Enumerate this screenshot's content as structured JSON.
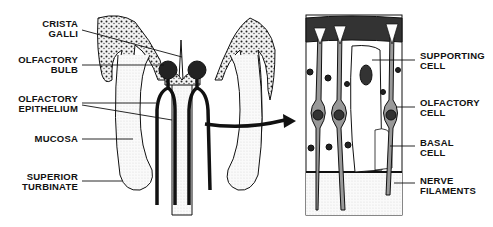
{
  "diagram": {
    "left_panel": {
      "labels": [
        {
          "line1": "CRISTA",
          "line2": "GALLI"
        },
        {
          "line1": "OLFACTORY",
          "line2": "BULB"
        },
        {
          "line1": "OLFACTORY",
          "line2": "EPITHELIUM"
        },
        {
          "line1": "MUCOSA",
          "line2": ""
        },
        {
          "line1": "SUPERIOR",
          "line2": "TURBINATE"
        }
      ]
    },
    "right_panel": {
      "labels": [
        {
          "line1": "SUPPORTING",
          "line2": "CELL"
        },
        {
          "line1": "OLFACTORY",
          "line2": "CELL"
        },
        {
          "line1": "BASAL",
          "line2": "CELL"
        },
        {
          "line1": "NERVE",
          "line2": "FILAMENTS"
        }
      ]
    },
    "colors": {
      "ink": "#111111",
      "background": "#ffffff",
      "stipple": "#d8d8d8"
    }
  }
}
